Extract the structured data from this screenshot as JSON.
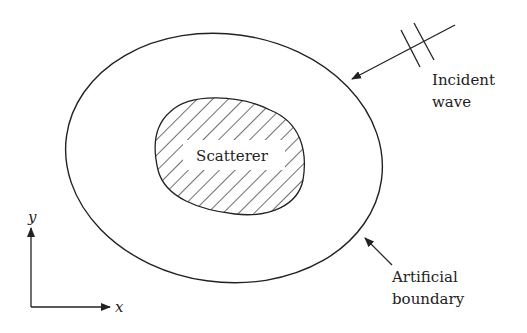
{
  "diagram": {
    "scatterer_label": "Scatterer",
    "incident_label_line1": "Incident",
    "incident_label_line2": "wave",
    "boundary_label_line1": "Artificial",
    "boundary_label_line2": "boundary",
    "axis_x_label": "x",
    "axis_y_label": "y",
    "colors": {
      "stroke": "#222222",
      "background": "#ffffff"
    }
  }
}
